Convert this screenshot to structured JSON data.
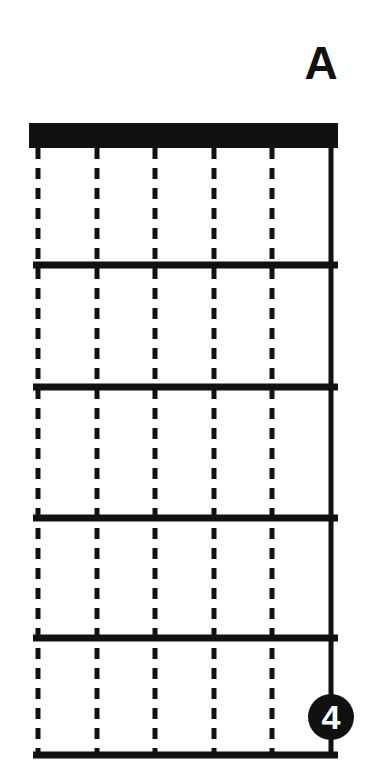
{
  "diagram": {
    "type": "guitar-chord-chart",
    "chord_name": "A",
    "orientation": "vertical",
    "string_count": 6,
    "fret_count": 5,
    "nut_shown": true,
    "colors": {
      "ink": "#111111",
      "paper": "#ffffff",
      "marker_fill": "#111111",
      "marker_text": "#ffffff"
    },
    "strings": [
      {
        "index": 1,
        "x": 38,
        "style": "dashed"
      },
      {
        "index": 2,
        "x": 97,
        "style": "dashed"
      },
      {
        "index": 3,
        "x": 155,
        "style": "dashed"
      },
      {
        "index": 4,
        "x": 214,
        "style": "dashed"
      },
      {
        "index": 5,
        "x": 272,
        "style": "dashed"
      },
      {
        "index": 6,
        "x": 331,
        "style": "solid"
      }
    ],
    "nut": {
      "x": 29,
      "y": 123,
      "width": 309,
      "height": 25
    },
    "frets": [
      {
        "index": 1,
        "y": 265
      },
      {
        "index": 2,
        "y": 387
      },
      {
        "index": 3,
        "y": 518
      },
      {
        "index": 4,
        "y": 638
      },
      {
        "index": 5,
        "y": 755
      }
    ],
    "fret_line": {
      "x_start": 33,
      "x_end": 338,
      "thickness": 7
    },
    "finger_markers": [
      {
        "label": "4",
        "string": 6,
        "fret": 5,
        "cx": 331,
        "cy": 717,
        "r": 23,
        "filled": true
      }
    ]
  }
}
